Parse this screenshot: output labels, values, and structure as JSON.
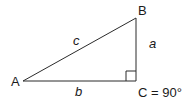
{
  "diagram": {
    "type": "right-triangle",
    "vertices": {
      "A": {
        "label": "A"
      },
      "B": {
        "label": "B"
      },
      "C": {
        "label": "C = 90°"
      }
    },
    "sides": {
      "a": {
        "label": "a"
      },
      "b": {
        "label": "b"
      },
      "c": {
        "label": "c"
      }
    },
    "colors": {
      "stroke": "#2b2b2b",
      "text": "#1a1a1a",
      "background": "#ffffff"
    }
  }
}
